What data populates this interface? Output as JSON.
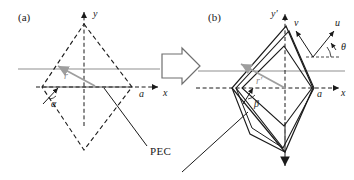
{
  "figure": {
    "width": 354,
    "height": 180,
    "background": "#ffffff"
  },
  "colors": {
    "line_dark": "#1a1a1a",
    "line_gray": "#8f8f8f",
    "vector_gray": "#9e9e9e",
    "text": "#1a1a1a",
    "background": "#ffffff"
  },
  "panels": [
    {
      "id": "a",
      "label": "(a)",
      "label_x": 18,
      "label_y": 12,
      "axes": {
        "y_label": "y",
        "y_label_x": 93,
        "y_label_y": 9,
        "x_label": "x",
        "x_label_x": 163,
        "x_label_y": 95,
        "origin_x": 84,
        "origin_y": 87
      },
      "annotations": [
        {
          "name": "radius-vector-label",
          "text": "r",
          "x": 64,
          "y": 72,
          "style": "gray"
        },
        {
          "name": "angle-alpha-label",
          "text": "α",
          "x": 51,
          "y": 101,
          "style": "dark"
        },
        {
          "name": "vertex-a-label",
          "text": "a",
          "x": 139,
          "y": 95,
          "style": "dark"
        }
      ]
    },
    {
      "id": "b",
      "label": "(b)",
      "label_x": 208,
      "label_y": 12,
      "axes": {
        "y_label": "y′",
        "y_label_x": 272,
        "y_label_y": 9,
        "x_label": "x",
        "x_label_x": 341,
        "x_label_y": 95,
        "origin_x": 285,
        "origin_y": 88
      },
      "annotations": [
        {
          "name": "radius-vector-label",
          "text": "r′",
          "x": 259,
          "y": 79,
          "style": "gray"
        },
        {
          "name": "angle-beta-label",
          "text": "β",
          "x": 254,
          "y": 101,
          "style": "dark"
        },
        {
          "name": "vertex-a-label",
          "text": "a",
          "x": 317,
          "y": 95,
          "style": "dark"
        }
      ],
      "uv_frame": {
        "u_label": "u",
        "u_label_x": 336,
        "u_label_y": 22,
        "v_label": "v",
        "v_label_x": 296,
        "v_label_y": 22,
        "theta_label": "θ",
        "theta_label_x": 341,
        "theta_label_y": 44,
        "vertex_x": 313,
        "vertex_y": 57
      }
    }
  ],
  "shared_labels": [
    {
      "name": "pec-label",
      "text": "PEC",
      "x": 150,
      "y": 152
    }
  ],
  "transform_arrow": {
    "name": "transform-arrow",
    "direction": "right",
    "x": 160,
    "y": 48,
    "width": 42,
    "height": 36
  }
}
